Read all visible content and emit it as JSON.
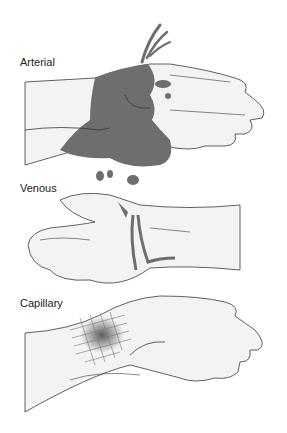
{
  "diagram": {
    "panels": [
      {
        "label": "Arterial",
        "description": "Hand with spurting blood from wrist"
      },
      {
        "label": "Venous",
        "description": "Hand with steady flowing blood from wrist"
      },
      {
        "label": "Capillary",
        "description": "Hand with oozing graze on wrist"
      }
    ]
  },
  "colors": {
    "skin": "#f3f3f3",
    "outline": "#3a3a3a",
    "blood": "#6e6e6e",
    "bruise": "#555555"
  }
}
